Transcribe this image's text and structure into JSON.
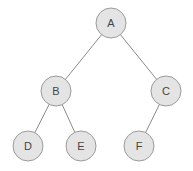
{
  "diagram": {
    "type": "binary-tree",
    "style": {
      "node_fill": "#e4e4e4",
      "node_stroke": "#9a9a9a",
      "edge_color": "#8a8a8a",
      "label_color": "#444444"
    },
    "nodes": [
      {
        "id": "A",
        "label": "A",
        "x": 111,
        "y": 23
      },
      {
        "id": "B",
        "label": "B",
        "x": 56,
        "y": 91
      },
      {
        "id": "C",
        "label": "C",
        "x": 166,
        "y": 91
      },
      {
        "id": "D",
        "label": "D",
        "x": 28,
        "y": 146
      },
      {
        "id": "E",
        "label": "E",
        "x": 81,
        "y": 146
      },
      {
        "id": "F",
        "label": "F",
        "x": 139,
        "y": 146
      }
    ],
    "edges": [
      {
        "from": "A",
        "to": "B"
      },
      {
        "from": "A",
        "to": "C"
      },
      {
        "from": "B",
        "to": "D"
      },
      {
        "from": "B",
        "to": "E"
      },
      {
        "from": "C",
        "to": "F"
      }
    ]
  }
}
